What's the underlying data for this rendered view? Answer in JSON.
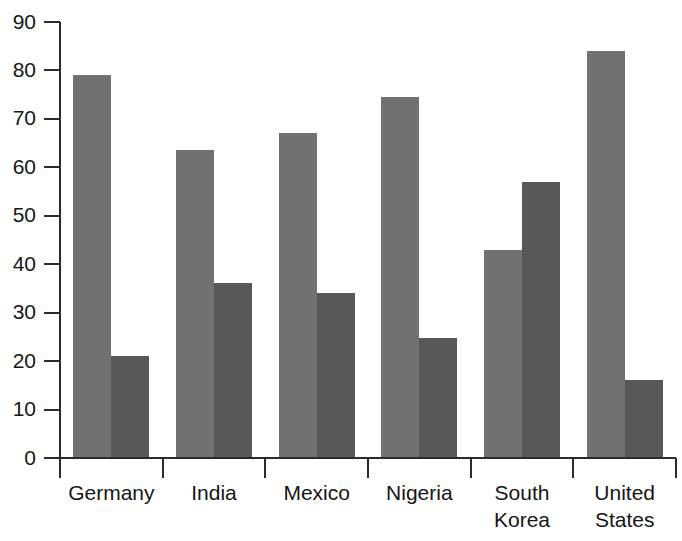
{
  "chart_data": {
    "type": "bar",
    "title": "",
    "subtitle": "",
    "xlabel": "",
    "ylabel": "",
    "ylim": [
      0,
      90
    ],
    "ytick_step": 10,
    "yticks": [
      "0",
      "10",
      "20",
      "30",
      "40",
      "50",
      "60",
      "70",
      "80",
      "90"
    ],
    "grid": false,
    "legend_position": "none",
    "categories": [
      "Germany",
      "India",
      "Mexico",
      "Nigeria",
      "South Korea",
      "United States"
    ],
    "category_label_lines": [
      [
        "Germany"
      ],
      [
        "India"
      ],
      [
        "Mexico"
      ],
      [
        "Nigeria"
      ],
      [
        "South",
        "Korea"
      ],
      [
        "United",
        "States"
      ]
    ],
    "series": [
      {
        "name": "Series 1",
        "color": "#717171",
        "values": [
          79,
          63.5,
          67,
          74.5,
          43,
          84
        ]
      },
      {
        "name": "Series 2",
        "color": "#585858",
        "values": [
          21,
          36.2,
          34,
          24.8,
          57,
          16
        ]
      }
    ]
  },
  "colors": {
    "series_light": "#717171",
    "series_dark": "#585858",
    "axis": "#2b2b2b",
    "text": "#151515",
    "background": "#ffffff"
  }
}
